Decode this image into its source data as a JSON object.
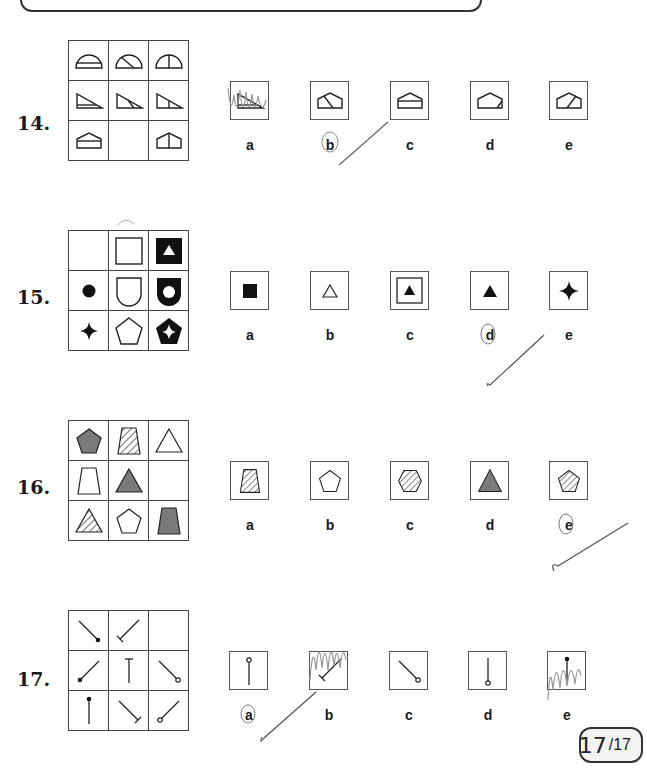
{
  "questions": [
    {
      "number": "14.",
      "options": [
        "a",
        "b",
        "c",
        "d",
        "e"
      ],
      "circled": "b"
    },
    {
      "number": "15.",
      "options": [
        "a",
        "b",
        "c",
        "d",
        "e"
      ],
      "circled": "d"
    },
    {
      "number": "16.",
      "options": [
        "a",
        "b",
        "c",
        "d",
        "e"
      ],
      "circled": "e"
    },
    {
      "number": "17.",
      "options": [
        "a",
        "b",
        "c",
        "d",
        "e"
      ],
      "circled": "a"
    }
  ],
  "score": {
    "handwritten": "17",
    "total": "/17"
  }
}
